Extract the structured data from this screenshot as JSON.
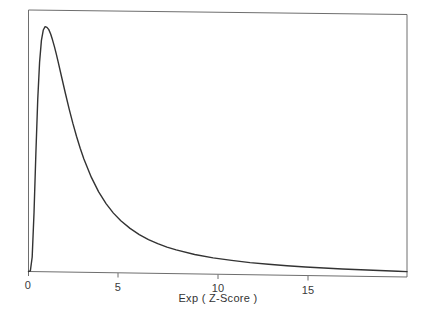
{
  "chart_data": {
    "type": "line",
    "title": "",
    "xlabel": "Exp ( Z-Score )",
    "ylabel": "Likelihood",
    "xlim": [
      0,
      20.5
    ],
    "ylim": [
      0,
      1.08
    ],
    "grid": false,
    "legend": null,
    "xticks": [
      0,
      5,
      10,
      15
    ],
    "xtick_labels": [
      "0",
      "5",
      "10",
      "15"
    ],
    "yticks": [],
    "ytick_labels": [],
    "annotations": [],
    "series": [
      {
        "name": "Likelihood",
        "color": "#333333",
        "x": [
          0.0,
          0.1,
          0.2,
          0.3,
          0.4,
          0.5,
          0.6,
          0.7,
          0.8,
          0.9,
          1.0,
          1.1,
          1.2,
          1.3,
          1.4,
          1.5,
          1.6,
          1.8,
          2.0,
          2.2,
          2.4,
          2.6,
          2.8,
          3.0,
          3.4,
          3.8,
          4.2,
          4.6,
          5.0,
          5.5,
          6.0,
          6.5,
          7.0,
          7.5,
          8.0,
          9.0,
          10.0,
          11.0,
          12.0,
          13.0,
          14.0,
          15.0,
          16.0,
          17.0,
          18.0,
          19.0,
          20.0,
          20.5
        ],
        "y": [
          0.0,
          0.003,
          0.06,
          0.245,
          0.49,
          0.71,
          0.865,
          0.955,
          0.998,
          1.012,
          1.009,
          1.0,
          0.982,
          0.958,
          0.931,
          0.901,
          0.869,
          0.803,
          0.737,
          0.674,
          0.615,
          0.561,
          0.512,
          0.468,
          0.393,
          0.333,
          0.285,
          0.246,
          0.215,
          0.184,
          0.159,
          0.139,
          0.123,
          0.109,
          0.098,
          0.08,
          0.067,
          0.058,
          0.05,
          0.044,
          0.039,
          0.035,
          0.032,
          0.029,
          0.027,
          0.025,
          0.023,
          0.022
        ]
      }
    ]
  },
  "axes": {
    "frame_color": "#6e6e6e",
    "curve_color": "#333333"
  }
}
